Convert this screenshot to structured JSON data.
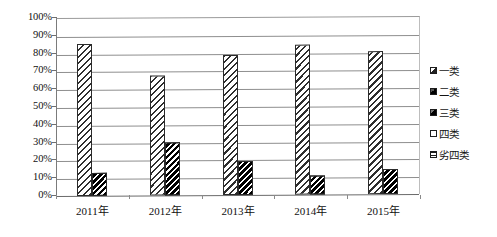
{
  "chart_data": {
    "type": "bar",
    "title": "",
    "subtitle": "",
    "xlabel": "",
    "ylabel": "",
    "categories": [
      "2011年",
      "2012年",
      "2013年",
      "2014年",
      "2015年"
    ],
    "ylim": [
      0,
      100
    ],
    "ytick_labels": [
      "0%",
      "10%",
      "20%",
      "30%",
      "40%",
      "50%",
      "60%",
      "70%",
      "80%",
      "90%",
      "100%"
    ],
    "ytick_values": [
      0,
      10,
      20,
      30,
      40,
      50,
      60,
      70,
      80,
      90,
      100
    ],
    "grid": true,
    "legend_position": "right",
    "series": [
      {
        "name": "一类",
        "values": [
          0,
          0,
          0,
          0,
          0
        ]
      },
      {
        "name": "二类",
        "values": [
          0,
          0,
          0,
          0,
          0
        ]
      },
      {
        "name": "三类",
        "values": [
          86,
          68,
          79,
          85,
          81
        ]
      },
      {
        "name": "四类",
        "values": [
          0,
          0,
          0,
          0,
          0
        ]
      },
      {
        "name": "劣四类",
        "values": [
          13,
          30,
          19,
          11,
          14
        ]
      }
    ],
    "visible_series": [
      "三类",
      "劣四类"
    ],
    "annotations": []
  },
  "legend": {
    "items": [
      {
        "label": "一类",
        "swatch": "legend-swatch-class-1"
      },
      {
        "label": "二类",
        "swatch": "legend-swatch-class-2"
      },
      {
        "label": "三类",
        "swatch": "legend-swatch-class-3"
      },
      {
        "label": "四类",
        "swatch": "legend-swatch-class-4"
      },
      {
        "label": "劣四类",
        "swatch": "legend-swatch-class-worse-4"
      }
    ]
  },
  "colors": {
    "bar_outline": "#2b2b2b",
    "hatch_ink": "#000000",
    "gridline": "#8e8e8e",
    "axis": "#6a6a6a",
    "text": "#111111",
    "background": "#ffffff"
  }
}
